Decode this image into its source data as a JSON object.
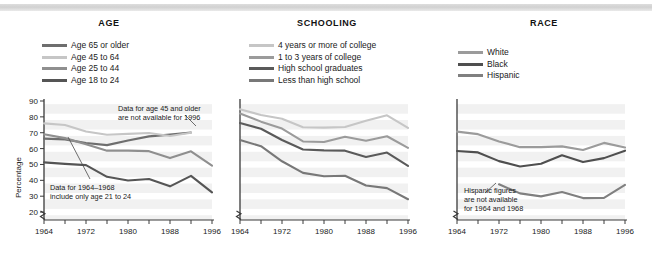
{
  "figure": {
    "ylabel": "Percentage",
    "yticks": [
      20,
      30,
      40,
      50,
      60,
      70,
      80,
      90
    ],
    "xticks": [
      1964,
      1972,
      1980,
      1988,
      1996
    ],
    "xtick_labels": [
      "1964",
      "1972",
      "1980",
      "1988",
      "1996"
    ],
    "years": [
      1964,
      1968,
      1972,
      1976,
      1980,
      1984,
      1988,
      1992,
      1996
    ],
    "ylim": [
      15,
      90
    ],
    "xlim": [
      1964,
      1996
    ],
    "axis_break": true,
    "grid": "horizontal-banded",
    "band_color": "#e8e8e8",
    "plot_bg": "#f1f1f1"
  },
  "panels": [
    {
      "key": "age",
      "title": "AGE",
      "legend": [
        {
          "label": "Age 65 or older",
          "color": "#6e6e6e"
        },
        {
          "label": "Age 45 to 64",
          "color": "#c6c6c6"
        },
        {
          "label": "Age 25 to 44",
          "color": "#8f8f8f"
        },
        {
          "label": "Age 18 to 24",
          "color": "#555555"
        }
      ],
      "notes": [
        {
          "lines": [
            "Data for age 45 and older",
            "are not available for 1996"
          ]
        },
        {
          "lines": [
            "Data for 1964–1968",
            "include only age 21 to 24"
          ]
        }
      ]
    },
    {
      "key": "schooling",
      "title": "SCHOOLING",
      "legend": [
        {
          "label": "4 years or more of college",
          "color": "#c6c6c6"
        },
        {
          "label": "1 to 3 years of college",
          "color": "#9b9b9b"
        },
        {
          "label": "High school graduates",
          "color": "#5a5a5a"
        },
        {
          "label": "Less than high school",
          "color": "#787878"
        }
      ],
      "notes": []
    },
    {
      "key": "race",
      "title": "RACE",
      "legend": [
        {
          "label": "White",
          "color": "#9b9b9b"
        },
        {
          "label": "Black",
          "color": "#4f4f4f"
        },
        {
          "label": "Hispanic",
          "color": "#808080"
        }
      ],
      "notes": [
        {
          "lines": [
            "Hispanic figures",
            "are not available",
            "for 1964 and 1968"
          ]
        }
      ]
    }
  ],
  "chart_data": [
    {
      "type": "line",
      "title": "AGE",
      "xlabel": "",
      "ylabel": "Percentage",
      "x": [
        1964,
        1968,
        1972,
        1976,
        1980,
        1984,
        1988,
        1992,
        1996
      ],
      "ylim": [
        15,
        90
      ],
      "series": [
        {
          "name": "Age 65 or older",
          "color": "#6e6e6e",
          "values": [
            66.3,
            65.8,
            63.5,
            62.2,
            65.1,
            67.7,
            68.8,
            70.1,
            null
          ]
        },
        {
          "name": "Age 45 to 64",
          "color": "#c6c6c6",
          "values": [
            75.9,
            74.9,
            70.8,
            68.7,
            69.3,
            69.8,
            67.9,
            70.0,
            null
          ]
        },
        {
          "name": "Age 25 to 44",
          "color": "#8f8f8f",
          "values": [
            69.0,
            66.6,
            62.7,
            58.7,
            58.7,
            58.4,
            54.0,
            58.3,
            49.2
          ]
        },
        {
          "name": "Age 18 to 24",
          "color": "#555555",
          "values": [
            51.3,
            50.4,
            49.6,
            42.2,
            39.9,
            40.8,
            36.2,
            42.8,
            32.4
          ]
        }
      ]
    },
    {
      "type": "line",
      "title": "SCHOOLING",
      "xlabel": "",
      "ylabel": "Percentage",
      "x": [
        1964,
        1968,
        1972,
        1976,
        1980,
        1984,
        1988,
        1992,
        1996
      ],
      "ylim": [
        15,
        90
      ],
      "series": [
        {
          "name": "4 years or more of college",
          "color": "#c6c6c6",
          "values": [
            84.8,
            81.2,
            78.8,
            73.5,
            73.2,
            73.6,
            77.6,
            81.0,
            73.0
          ]
        },
        {
          "name": "1 to 3 years of college",
          "color": "#9b9b9b",
          "values": [
            82.1,
            77.0,
            72.6,
            64.5,
            64.2,
            67.5,
            65.0,
            67.8,
            60.5
          ]
        },
        {
          "name": "High school graduates",
          "color": "#5a5a5a",
          "values": [
            76.1,
            72.5,
            65.4,
            59.4,
            58.9,
            58.7,
            54.7,
            57.5,
            49.1
          ]
        },
        {
          "name": "Less than high school",
          "color": "#787878",
          "values": [
            65.4,
            61.5,
            52.0,
            44.7,
            42.6,
            42.9,
            36.7,
            35.1,
            28.1
          ]
        }
      ]
    },
    {
      "type": "line",
      "title": "RACE",
      "xlabel": "",
      "ylabel": "Percentage",
      "x": [
        1964,
        1968,
        1972,
        1976,
        1980,
        1984,
        1988,
        1992,
        1996
      ],
      "ylim": [
        15,
        90
      ],
      "series": [
        {
          "name": "White",
          "color": "#9b9b9b",
          "values": [
            70.7,
            69.1,
            64.5,
            60.9,
            60.9,
            61.4,
            59.1,
            63.6,
            60.7
          ]
        },
        {
          "name": "Black",
          "color": "#4f4f4f",
          "values": [
            58.5,
            57.6,
            52.1,
            48.7,
            50.5,
            55.8,
            51.5,
            54.0,
            58.7
          ]
        },
        {
          "name": "Hispanic",
          "color": "#808080",
          "values": [
            null,
            null,
            37.5,
            31.8,
            29.9,
            32.6,
            28.8,
            28.9,
            37.1
          ]
        }
      ]
    }
  ]
}
